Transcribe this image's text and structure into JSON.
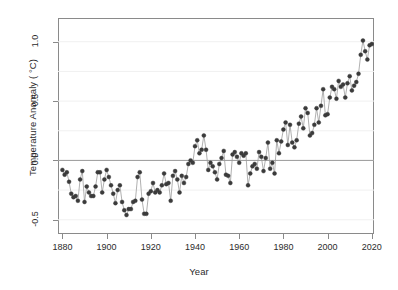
{
  "chart_data": {
    "type": "line",
    "title": "",
    "subtitle": "",
    "xlabel": "Year",
    "ylabel": "Temperature Anomaly ( °C)",
    "xlim": [
      1878,
      2021
    ],
    "ylim": [
      -0.62,
      1.2
    ],
    "xticks": [
      1880,
      1900,
      1920,
      1940,
      1960,
      1980,
      2000,
      2020
    ],
    "xtick_labels": [
      "1880",
      "1900",
      "1920",
      "1940",
      "1960",
      "1980",
      "2000",
      "2020"
    ],
    "yticks": [
      -0.5,
      0.0,
      0.5,
      1.0
    ],
    "ytick_labels": [
      "-0.5",
      "0.0",
      "0.5",
      "1.0"
    ],
    "grid": true,
    "grid_interval": 0.25,
    "grid_color": "#f0f0f0",
    "zero_line": 0.0,
    "zero_line_color": "#9a9a9a",
    "legend": null,
    "marker": "filled-circle",
    "marker_color": "#3b3b3b",
    "line_color": "#9c9c9c",
    "series": [
      {
        "name": "Global Temperature Anomaly",
        "x": [
          1880,
          1881,
          1882,
          1883,
          1884,
          1885,
          1886,
          1887,
          1888,
          1889,
          1890,
          1891,
          1892,
          1893,
          1894,
          1895,
          1896,
          1897,
          1898,
          1899,
          1900,
          1901,
          1902,
          1903,
          1904,
          1905,
          1906,
          1907,
          1908,
          1909,
          1910,
          1911,
          1912,
          1913,
          1914,
          1915,
          1916,
          1917,
          1918,
          1919,
          1920,
          1921,
          1922,
          1923,
          1924,
          1925,
          1926,
          1927,
          1928,
          1929,
          1930,
          1931,
          1932,
          1933,
          1934,
          1935,
          1936,
          1937,
          1938,
          1939,
          1940,
          1941,
          1942,
          1943,
          1944,
          1945,
          1946,
          1947,
          1948,
          1949,
          1950,
          1951,
          1952,
          1953,
          1954,
          1955,
          1956,
          1957,
          1958,
          1959,
          1960,
          1961,
          1962,
          1963,
          1964,
          1965,
          1966,
          1967,
          1968,
          1969,
          1970,
          1971,
          1972,
          1973,
          1974,
          1975,
          1976,
          1977,
          1978,
          1979,
          1980,
          1981,
          1982,
          1983,
          1984,
          1985,
          1986,
          1987,
          1988,
          1989,
          1990,
          1991,
          1992,
          1993,
          1994,
          1995,
          1996,
          1997,
          1998,
          1999,
          2000,
          2001,
          2002,
          2003,
          2004,
          2005,
          2006,
          2007,
          2008,
          2009,
          2010,
          2011,
          2012,
          2013,
          2014,
          2015,
          2016,
          2017,
          2018,
          2019,
          2020
        ],
        "values": [
          -0.08,
          -0.12,
          -0.1,
          -0.18,
          -0.28,
          -0.31,
          -0.3,
          -0.34,
          -0.16,
          -0.09,
          -0.35,
          -0.22,
          -0.27,
          -0.3,
          -0.3,
          -0.22,
          -0.1,
          -0.1,
          -0.27,
          -0.16,
          -0.08,
          -0.14,
          -0.21,
          -0.28,
          -0.36,
          -0.25,
          -0.21,
          -0.35,
          -0.42,
          -0.46,
          -0.41,
          -0.41,
          -0.35,
          -0.34,
          -0.14,
          -0.1,
          -0.33,
          -0.45,
          -0.45,
          -0.28,
          -0.26,
          -0.19,
          -0.27,
          -0.25,
          -0.27,
          -0.21,
          -0.11,
          -0.2,
          -0.19,
          -0.34,
          -0.13,
          -0.09,
          -0.16,
          -0.27,
          -0.13,
          -0.19,
          -0.14,
          -0.03,
          0.0,
          -0.02,
          0.12,
          0.17,
          0.06,
          0.09,
          0.21,
          0.09,
          -0.08,
          -0.02,
          -0.05,
          -0.1,
          -0.16,
          -0.03,
          0.02,
          0.08,
          -0.12,
          -0.13,
          -0.19,
          0.05,
          0.07,
          0.03,
          -0.02,
          0.06,
          0.04,
          0.06,
          -0.21,
          -0.11,
          -0.05,
          -0.03,
          -0.07,
          0.07,
          0.03,
          -0.09,
          0.02,
          0.15,
          -0.07,
          -0.02,
          -0.11,
          0.17,
          0.06,
          0.16,
          0.26,
          0.32,
          0.13,
          0.3,
          0.15,
          0.11,
          0.17,
          0.31,
          0.37,
          0.27,
          0.44,
          0.4,
          0.21,
          0.23,
          0.3,
          0.44,
          0.32,
          0.46,
          0.6,
          0.38,
          0.39,
          0.53,
          0.62,
          0.6,
          0.52,
          0.67,
          0.62,
          0.64,
          0.53,
          0.65,
          0.71,
          0.59,
          0.63,
          0.66,
          0.73,
          0.89,
          1.01,
          0.92,
          0.85,
          0.97,
          0.98
        ]
      }
    ]
  },
  "axes": {
    "y_title": "Temperature Anomaly ( °C)",
    "x_title": "Year"
  }
}
